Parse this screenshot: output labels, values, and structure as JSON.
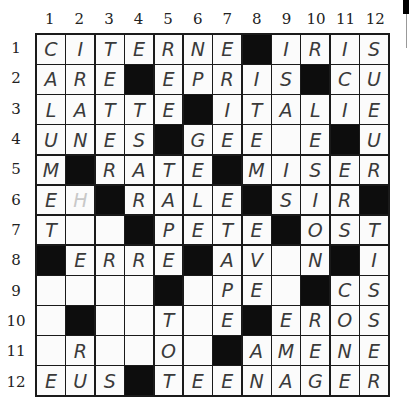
{
  "puzzle": {
    "type": "crossword",
    "size": 12,
    "column_labels": [
      "1",
      "2",
      "3",
      "4",
      "5",
      "6",
      "7",
      "8",
      "9",
      "10",
      "11",
      "12"
    ],
    "row_labels": [
      "1",
      "2",
      "3",
      "4",
      "5",
      "6",
      "7",
      "8",
      "9",
      "10",
      "11",
      "12"
    ],
    "legend": {
      "#": "black square",
      ".": "empty square"
    },
    "grid": [
      [
        "C",
        "I",
        "T",
        "E",
        "R",
        "N",
        "E",
        "#",
        "I",
        "R",
        "I",
        "S"
      ],
      [
        "A",
        "R",
        "E",
        "#",
        "E",
        "P",
        "R",
        "I",
        "S",
        "#",
        "C",
        "U"
      ],
      [
        "L",
        "A",
        "T",
        "T",
        "E",
        "#",
        "I",
        "T",
        "A",
        "L",
        "I",
        "E"
      ],
      [
        "U",
        "N",
        "E",
        "S",
        "#",
        "G",
        "E",
        "E",
        ".",
        "E",
        "#",
        "U"
      ],
      [
        "M",
        "#",
        "R",
        "A",
        "T",
        "E",
        "#",
        "M",
        "I",
        "S",
        "E",
        "R"
      ],
      [
        "E",
        "H",
        "#",
        "R",
        "A",
        "L",
        "E",
        "#",
        "S",
        "I",
        "R",
        "#"
      ],
      [
        "T",
        ".",
        ".",
        "#",
        "P",
        "E",
        "T",
        "E",
        "#",
        "O",
        "S",
        "T"
      ],
      [
        "#",
        "E",
        "R",
        "R",
        "E",
        "#",
        "A",
        "V",
        ".",
        "N",
        "#",
        "I"
      ],
      [
        ".",
        ".",
        ".",
        ".",
        "#",
        ".",
        "P",
        "E",
        ".",
        "#",
        "C",
        "S"
      ],
      [
        ".",
        "#",
        ".",
        ".",
        "T",
        ".",
        "E",
        "#",
        "E",
        "R",
        "O",
        "S"
      ],
      [
        ".",
        "R",
        ".",
        ".",
        "O",
        ".",
        "#",
        "A",
        "M",
        "E",
        "N",
        "E"
      ],
      [
        "E",
        "U",
        "S",
        "#",
        "T",
        "E",
        "E",
        "N",
        "A",
        "G",
        "E",
        "R"
      ]
    ],
    "faint_cells": [
      [
        6,
        2
      ]
    ]
  }
}
